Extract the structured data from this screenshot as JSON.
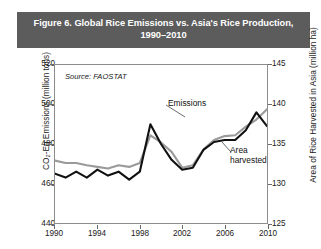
{
  "figure": {
    "title": "Figure 6. Global Rice Emissions vs. Asia's Rice Production, 1990–2010",
    "title_line1": "Figure 6. Global Rice Emissions vs. Asia's Rice Production,",
    "title_line2": "1990–2010",
    "header_color": "#5c5c5c",
    "header_text_color": "#ffffff"
  },
  "annotations": {
    "source": "Source: FAOSTAT",
    "emissions_label": "Emissions",
    "area_label_line1": "Area",
    "area_label_line2": "harvested"
  },
  "chart_data": {
    "type": "line",
    "title": "Figure 6. Global Rice Emissions vs. Asia's Rice Production, 1990–2010",
    "xlabel": "",
    "ylabel": "CO₂-Eq Emissions (million tons)",
    "y2label": "Area of Rice Harvested in Asia (million ha)",
    "xlim": [
      1990,
      2010
    ],
    "ylim": [
      440,
      520
    ],
    "y2lim": [
      125,
      145
    ],
    "xticks": [
      1990,
      1994,
      1998,
      2002,
      2006,
      2010
    ],
    "xtick_labels": [
      "1990",
      "1994",
      "1998",
      "2002",
      "2006",
      "2010"
    ],
    "yticks": [
      440,
      460,
      480,
      500,
      520
    ],
    "ytick_labels": [
      "440",
      "460",
      "480",
      "500",
      "520"
    ],
    "y2ticks": [
      125,
      130,
      135,
      140,
      145
    ],
    "y2tick_labels": [
      "125",
      "130",
      "135",
      "140",
      "145"
    ],
    "grid": false,
    "legend": "inline-annotations",
    "x": [
      1990,
      1991,
      1992,
      1993,
      1994,
      1995,
      1996,
      1997,
      1998,
      1999,
      2000,
      2001,
      2002,
      2003,
      2004,
      2005,
      2006,
      2007,
      2008,
      2009,
      2010
    ],
    "series": [
      {
        "name": "Emissions",
        "axis": "left",
        "units": "million tons CO2-Eq",
        "color": "#111111",
        "values": [
          465,
          463,
          466,
          463,
          467,
          464,
          466,
          462,
          466,
          490,
          480,
          472,
          467,
          468,
          477,
          481,
          482,
          482,
          487,
          496,
          489
        ]
      },
      {
        "name": "Area harvested",
        "axis": "right",
        "units": "million ha",
        "color": "#9a9a9a",
        "values": [
          132.9,
          132.6,
          132.6,
          132.3,
          132.1,
          131.9,
          132.3,
          132.1,
          132.6,
          136.1,
          135.2,
          134.0,
          132.0,
          132.3,
          134.3,
          135.5,
          136.0,
          136.1,
          137.2,
          138.1,
          139.4
        ]
      }
    ]
  }
}
